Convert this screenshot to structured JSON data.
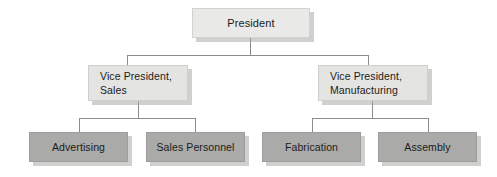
{
  "chart_data": {
    "type": "diagram",
    "diagram_type": "organization-chart",
    "title": "",
    "orientation": "top-down",
    "levels": 3,
    "nodes": [
      {
        "id": "president",
        "label": "President",
        "level": 1,
        "parent": null,
        "style": "light",
        "text_align": "center"
      },
      {
        "id": "vp-sales",
        "label": "Vice President,\nSales",
        "level": 2,
        "parent": "president",
        "style": "light",
        "text_align": "left"
      },
      {
        "id": "vp-manufacturing",
        "label": "Vice President,\nManufacturing",
        "level": 2,
        "parent": "president",
        "style": "light",
        "text_align": "left"
      },
      {
        "id": "advertising",
        "label": "Advertising",
        "level": 3,
        "parent": "vp-sales",
        "style": "dark",
        "text_align": "center"
      },
      {
        "id": "sales-personnel",
        "label": "Sales Personnel",
        "level": 3,
        "parent": "vp-sales",
        "style": "dark",
        "text_align": "center"
      },
      {
        "id": "fabrication",
        "label": "Fabrication",
        "level": 3,
        "parent": "vp-manufacturing",
        "style": "dark",
        "text_align": "center"
      },
      {
        "id": "assembly",
        "label": "Assembly",
        "level": 3,
        "parent": "vp-manufacturing",
        "style": "dark",
        "text_align": "center"
      }
    ],
    "edges": [
      {
        "from": "president",
        "to": "vp-sales"
      },
      {
        "from": "president",
        "to": "vp-manufacturing"
      },
      {
        "from": "vp-sales",
        "to": "advertising"
      },
      {
        "from": "vp-sales",
        "to": "sales-personnel"
      },
      {
        "from": "vp-manufacturing",
        "to": "fabrication"
      },
      {
        "from": "vp-manufacturing",
        "to": "assembly"
      }
    ],
    "colors": {
      "background": "#ffffff",
      "node_light_fill": "#e9e9e7",
      "node_light_border": "#d2d2d0",
      "node_dark_fill": "#aaaaa8",
      "node_dark_border": "#9d9d9b",
      "connector": "#8c8c8a",
      "shadow": "#aaaaa8",
      "text": "#1b1b1b"
    }
  },
  "chart": {
    "president": {
      "label": "President"
    },
    "vp_sales": {
      "label": "Vice President,\nSales"
    },
    "vp_manufacturing": {
      "label": "Vice President,\nManufacturing"
    },
    "advertising": {
      "label": "Advertising"
    },
    "sales_personnel": {
      "label": "Sales Personnel"
    },
    "fabrication": {
      "label": "Fabrication"
    },
    "assembly": {
      "label": "Assembly"
    }
  }
}
